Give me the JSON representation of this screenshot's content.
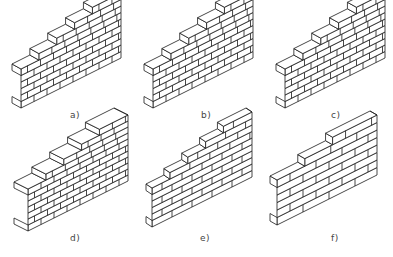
{
  "figure": {
    "panels": [
      {
        "id": "a",
        "label": "a)",
        "courses": 6,
        "steps": 4,
        "bond": "running"
      },
      {
        "id": "b",
        "label": "b)",
        "courses": 6,
        "steps": 4,
        "bond": "running"
      },
      {
        "id": "c",
        "label": "c)",
        "courses": 6,
        "steps": 4,
        "bond": "running"
      },
      {
        "id": "d",
        "label": "d)",
        "courses": 7,
        "steps": 4,
        "bond": "running"
      },
      {
        "id": "e",
        "label": "e)",
        "courses": 6,
        "steps": 4,
        "bond": "stretcher"
      },
      {
        "id": "f",
        "label": "f)",
        "courses": 6,
        "steps": 2,
        "bond": "block"
      }
    ]
  },
  "colors": {
    "line": "#1a1a1a",
    "background": "#ffffff",
    "label": "#444444"
  }
}
